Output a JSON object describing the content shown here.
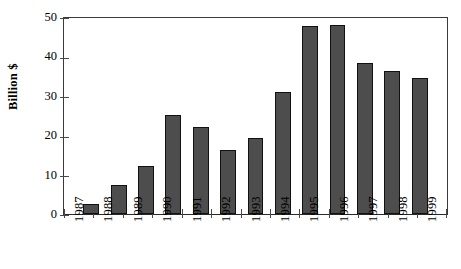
{
  "chart_data": {
    "type": "bar",
    "title": "",
    "subtitle": "",
    "xlabel": "",
    "ylabel": "Billion $",
    "categories": [
      "1987",
      "1988",
      "1989",
      "1990",
      "1991",
      "1992",
      "1993",
      "1994",
      "1995",
      "1996",
      "1997",
      "1998",
      "1999"
    ],
    "values": [
      2.5,
      7.5,
      12.3,
      25.3,
      22.2,
      16.3,
      19.3,
      31.2,
      48.0,
      48.3,
      38.5,
      36.6,
      34.8
    ],
    "ylim": [
      0,
      50
    ],
    "yticks": [
      0,
      10,
      20,
      30,
      40,
      50
    ],
    "ytick_labels": [
      "0",
      "10",
      "20",
      "30",
      "40",
      "50"
    ],
    "grid": false,
    "legend": null,
    "legend_position": "none",
    "bar_fill_color": "#4d4d4d",
    "bar_edge_color": "#111111",
    "axis_color": "#3a3a3a",
    "background_color": "#ffffff",
    "xtick_rotation": 90
  }
}
